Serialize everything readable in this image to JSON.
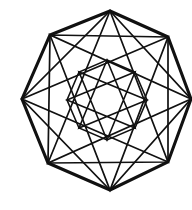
{
  "figure": {
    "kind": "line-drawing",
    "background_color": "#ffffff",
    "stroke_color": "#111111",
    "canvas": {
      "width": 192,
      "height": 210
    }
  },
  "chart_data": {
    "type": "line",
    "xlabel": "",
    "ylabel": "",
    "grid": false,
    "legend_position": "none",
    "xlim": [
      0,
      192
    ],
    "ylim": [
      0,
      210
    ],
    "geometry": {
      "center": [
        107,
        100
      ],
      "sides": 8,
      "rotation_deg": -90,
      "rings": [
        {
          "name": "outer-octagon",
          "radius": 90,
          "skip": 1,
          "stroke_width": 3.1
        },
        {
          "name": "octagram-skip2",
          "radius": 90,
          "skip": 2,
          "stroke_width": 1.7
        },
        {
          "name": "octagram-skip3",
          "radius": 90,
          "skip": 3,
          "stroke_width": 1.7
        },
        {
          "name": "inner-octagon",
          "radius": 40,
          "skip": 1,
          "stroke_width": 1.6
        },
        {
          "name": "inner-octagram-skip2",
          "radius": 40,
          "skip": 2,
          "stroke_width": 1.6
        },
        {
          "name": "inner-octagram-skip3",
          "radius": 40,
          "skip": 3,
          "stroke_width": 1.6
        }
      ]
    },
    "vertices": {
      "labels": [
        "top",
        "upper-right",
        "right",
        "lower-right",
        "bottom",
        "lower-left",
        "left",
        "upper-left"
      ],
      "points": [
        [
          110,
          11
        ],
        [
          168,
          37
        ],
        [
          191,
          99
        ],
        [
          168,
          162
        ],
        [
          110,
          190
        ],
        [
          48,
          163
        ],
        [
          22,
          99
        ],
        [
          50,
          35
        ]
      ]
    },
    "series": [
      {
        "name": "outer-octagon",
        "class": "poly-outer",
        "closed": true,
        "points": [
          [
            110,
            11
          ],
          [
            168,
            37
          ],
          [
            191,
            99
          ],
          [
            168,
            162
          ],
          [
            110,
            190
          ],
          [
            48,
            163
          ],
          [
            22,
            99
          ],
          [
            50,
            35
          ]
        ]
      },
      {
        "name": "octagram-skip2-ring-a",
        "class": "poly-star-a",
        "closed": true,
        "points": [
          [
            110,
            11
          ],
          [
            191,
            99
          ],
          [
            110,
            190
          ],
          [
            22,
            99
          ]
        ]
      },
      {
        "name": "octagram-skip2-ring-b",
        "class": "poly-star-a",
        "closed": true,
        "points": [
          [
            168,
            37
          ],
          [
            168,
            162
          ],
          [
            48,
            163
          ],
          [
            50,
            35
          ]
        ]
      },
      {
        "name": "octagram-skip3",
        "class": "poly-star-b",
        "closed": true,
        "points": [
          [
            110,
            11
          ],
          [
            168,
            162
          ],
          [
            22,
            99
          ],
          [
            168,
            37
          ],
          [
            110,
            190
          ],
          [
            50,
            35
          ],
          [
            191,
            99
          ],
          [
            48,
            163
          ]
        ]
      },
      {
        "name": "inner-octagon",
        "class": "poly-inner",
        "closed": true,
        "points": [
          [
            107,
            60
          ],
          [
            135,
            72
          ],
          [
            147,
            100
          ],
          [
            135,
            128
          ],
          [
            107,
            140
          ],
          [
            79,
            128
          ],
          [
            67,
            100
          ],
          [
            79,
            72
          ]
        ]
      },
      {
        "name": "inner-octagram-skip3",
        "class": "poly-inner",
        "closed": true,
        "points": [
          [
            107,
            60
          ],
          [
            135,
            128
          ],
          [
            67,
            100
          ],
          [
            135,
            72
          ],
          [
            107,
            140
          ],
          [
            79,
            72
          ],
          [
            147,
            100
          ],
          [
            79,
            128
          ]
        ]
      }
    ]
  }
}
